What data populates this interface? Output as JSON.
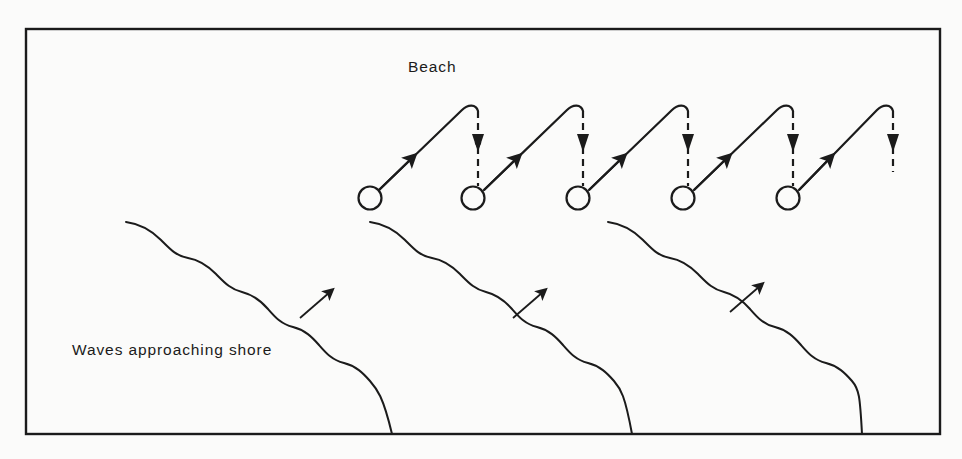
{
  "figure": {
    "type": "diagram",
    "background_color": "#fbfbfa",
    "ink_color": "#1b1b1b",
    "frame": {
      "name": "figure-border",
      "x": 26,
      "y": 29,
      "width": 914,
      "height": 405,
      "stroke_width": 2.4
    },
    "labels": [
      {
        "id": "beach",
        "text": "Beach",
        "x": 408,
        "y": 72,
        "font_size": 15.5
      },
      {
        "id": "waves",
        "text": "Waves approaching shore",
        "x": 72,
        "y": 355,
        "font_size": 15.5
      }
    ],
    "swash_paths": {
      "count": 5,
      "description": "Zigzag sediment transport: solid diagonal up-beach with arrowhead, rounded apex, dashed vertical backwash with arrowhead",
      "circle_radius": 11.5,
      "circle_centers_x": [
        370,
        473,
        578,
        683,
        788
      ],
      "circle_center_y": 198,
      "apex_y": 104,
      "dash_pattern": "7 5",
      "stroke_width": 2.2,
      "last_has_no_end_circle": true
    },
    "wave_crests": {
      "count": 3,
      "description": "Scalloped wave crest lines running from upper-left to lower-right toward the shore",
      "start_points": [
        {
          "x": 126,
          "y": 222
        },
        {
          "x": 370,
          "y": 222
        },
        {
          "x": 608,
          "y": 222
        }
      ],
      "end_points": [
        {
          "x": 392,
          "y": 434
        },
        {
          "x": 632,
          "y": 434
        },
        {
          "x": 862,
          "y": 434
        }
      ],
      "scallop_count": 9,
      "stroke_width": 2.0
    },
    "direction_arrows": {
      "count": 3,
      "description": "Wave approach direction arrows pointing up-beach to the right",
      "positions": [
        {
          "x": 316,
          "y": 314,
          "angle_deg": -58
        },
        {
          "x": 529,
          "y": 314,
          "angle_deg": -58
        },
        {
          "x": 746,
          "y": 308,
          "angle_deg": -58
        }
      ],
      "length": 38
    }
  }
}
